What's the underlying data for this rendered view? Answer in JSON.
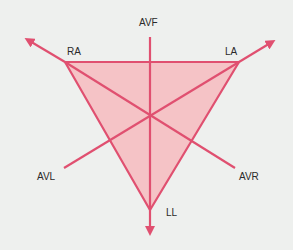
{
  "diagram": {
    "type": "Einthoven triangle with augmented limb leads",
    "colors": {
      "background": "#eef0ee",
      "stroke": "#e05070",
      "fill": "#f5c3c6",
      "text": "#2a2a2a"
    },
    "labels": {
      "ra": "RA",
      "la": "LA",
      "ll": "LL",
      "avf": "AVF",
      "avl": "AVL",
      "avr": "AVR"
    },
    "vertices": {
      "RA": [
        65,
        62
      ],
      "LA": [
        239,
        62
      ],
      "LL": [
        150,
        210
      ]
    },
    "center": [
      150,
      116
    ]
  }
}
